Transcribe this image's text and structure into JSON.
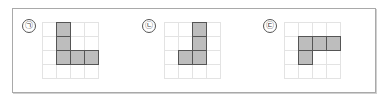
{
  "figures": [
    {
      "label": "㉠",
      "rows": 4,
      "cols": 4,
      "filled": [
        [
          0,
          1
        ],
        [
          1,
          1
        ],
        [
          2,
          1
        ],
        [
          2,
          2
        ],
        [
          2,
          3
        ]
      ]
    },
    {
      "label": "㉡",
      "rows": 4,
      "cols": 4,
      "filled": [
        [
          0,
          2
        ],
        [
          1,
          2
        ],
        [
          2,
          1
        ],
        [
          2,
          2
        ]
      ]
    },
    {
      "label": "㉢",
      "rows": 4,
      "cols": 4,
      "filled": [
        [
          1,
          1
        ],
        [
          1,
          2
        ],
        [
          1,
          3
        ],
        [
          2,
          1
        ]
      ]
    }
  ],
  "colors": {
    "filled": "#bdbdbd",
    "grid_line": "#e3e3e3",
    "outline": "#555555",
    "frame": "#a9a9a9"
  }
}
